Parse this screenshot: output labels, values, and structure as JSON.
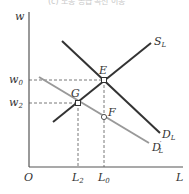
{
  "header": {
    "partial_caption": "(c) 노동 공급 곡선 이동"
  },
  "axes": {
    "y_label": "w",
    "x_label": "L",
    "origin_label": "O"
  },
  "wage_levels": [
    {
      "id": "w0",
      "base": "w",
      "sub": "0"
    },
    {
      "id": "w2",
      "base": "w",
      "sub": "2"
    }
  ],
  "quantity_levels": [
    {
      "id": "L2",
      "base": "L",
      "sub": "2"
    },
    {
      "id": "L0",
      "base": "L",
      "sub": "0"
    }
  ],
  "curves": [
    {
      "id": "S_L",
      "base": "S",
      "sub": "L",
      "color": "#333333"
    },
    {
      "id": "D_L",
      "base": "D",
      "sub": "L",
      "color": "#333333"
    },
    {
      "id": "D_L_prime",
      "base": "D",
      "sub": "L",
      "prime": "′",
      "color": "#999999"
    }
  ],
  "points": [
    {
      "id": "E",
      "label": "E"
    },
    {
      "id": "G",
      "label": "G"
    },
    {
      "id": "F",
      "label": "F"
    }
  ],
  "colors": {
    "axis": "#555555",
    "dark_curve": "#333333",
    "light_curve": "#999999",
    "dashed": "#555555"
  }
}
